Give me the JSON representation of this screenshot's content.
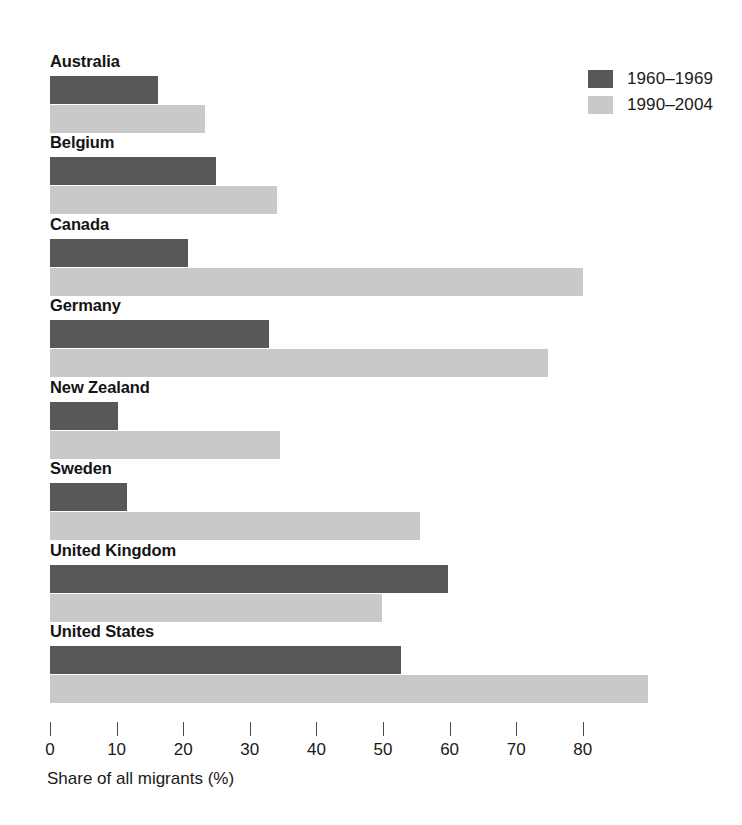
{
  "chart_data": {
    "type": "bar",
    "orientation": "horizontal",
    "title": "",
    "xlabel": "Share of all migrants (%)",
    "ylabel": "",
    "xlim": [
      0,
      90
    ],
    "xticks": [
      0,
      10,
      20,
      30,
      40,
      50,
      60,
      70,
      80
    ],
    "grid": false,
    "legend_position": "top-right",
    "categories": [
      "Australia",
      "Belgium",
      "Canada",
      "Germany",
      "New Zealand",
      "Sweden",
      "United Kingdom",
      "United States"
    ],
    "series": [
      {
        "name": "1960–1969",
        "color": "#585858",
        "values": [
          16.2,
          24.9,
          20.7,
          32.9,
          10.2,
          11.6,
          59.8,
          52.7
        ]
      },
      {
        "name": "1990–2004",
        "color": "#c9c9c9",
        "values": [
          23.3,
          34.1,
          80.0,
          74.8,
          34.5,
          55.6,
          49.8,
          89.8
        ]
      }
    ]
  },
  "axis": {
    "title": "Share of all migrants (%)",
    "tick_labels": [
      "0",
      "10",
      "20",
      "30",
      "40",
      "50",
      "60",
      "70",
      "80"
    ]
  },
  "legend": {
    "items": [
      {
        "label": "1960–1969",
        "color": "#585858"
      },
      {
        "label": "1990–2004",
        "color": "#c9c9c9"
      }
    ]
  },
  "colors": {
    "series_1960_1969": "#585858",
    "series_1990_2004": "#c9c9c9",
    "text": "#1a1a1a",
    "background": "#ffffff"
  }
}
